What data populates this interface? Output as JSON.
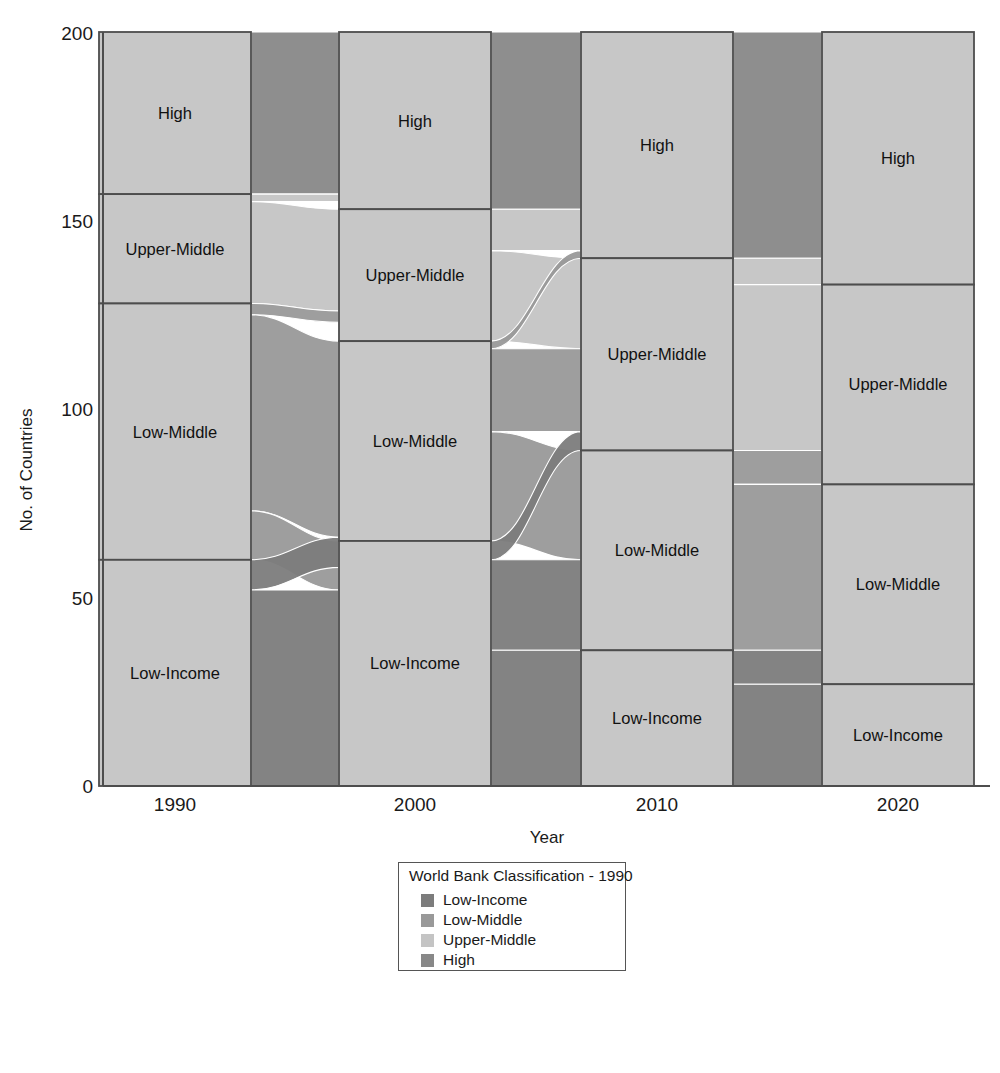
{
  "chart_data": {
    "type": "area",
    "subtype": "alluvial-sankey",
    "title": "",
    "xlabel": "Year",
    "ylabel": "No. of Countries",
    "ylim": [
      0,
      200
    ],
    "yticks": [
      0,
      50,
      100,
      150,
      200
    ],
    "ytick_labels": [
      "0",
      "50",
      "100",
      "150",
      "200"
    ],
    "grid": false,
    "legend_position": "bottom-center",
    "categories": [
      "1990",
      "2000",
      "2010",
      "2020"
    ],
    "classes": [
      "Low-Income",
      "Low-Middle",
      "Upper-Middle",
      "High"
    ],
    "colors": {
      "Low-Income": "#7c7c7c",
      "Low-Middle": "#999999",
      "Upper-Middle": "#c4c4c4",
      "High": "#888888",
      "stratum_fill": "#bbbbbb",
      "stratum_border": "#4d4d4d",
      "axis": "#4d4d4d"
    },
    "strata": [
      {
        "year": "1990",
        "values": {
          "Low-Income": 60,
          "Low-Middle": 68,
          "Upper-Middle": 29,
          "High": 43
        }
      },
      {
        "year": "2000",
        "values": {
          "Low-Income": 65,
          "Low-Middle": 53,
          "Upper-Middle": 35,
          "High": 47
        }
      },
      {
        "year": "2010",
        "values": {
          "Low-Income": 36,
          "Low-Middle": 53,
          "Upper-Middle": 51,
          "High": 60
        }
      },
      {
        "year": "2020",
        "values": {
          "Low-Income": 27,
          "Low-Middle": 53,
          "Upper-Middle": 53,
          "High": 67
        }
      }
    ],
    "flows": [
      {
        "from_year": "1990",
        "to_year": "2000",
        "from": "Low-Income",
        "to": "Low-Income",
        "value": 52
      },
      {
        "from_year": "1990",
        "to_year": "2000",
        "from": "Low-Income",
        "to": "Low-Middle",
        "value": 8
      },
      {
        "from_year": "1990",
        "to_year": "2000",
        "from": "Low-Middle",
        "to": "Low-Income",
        "value": 13
      },
      {
        "from_year": "1990",
        "to_year": "2000",
        "from": "Low-Middle",
        "to": "Low-Middle",
        "value": 52
      },
      {
        "from_year": "1990",
        "to_year": "2000",
        "from": "Low-Middle",
        "to": "Upper-Middle",
        "value": 3
      },
      {
        "from_year": "1990",
        "to_year": "2000",
        "from": "Upper-Middle",
        "to": "Upper-Middle",
        "value": 27
      },
      {
        "from_year": "1990",
        "to_year": "2000",
        "from": "Upper-Middle",
        "to": "High",
        "value": 2
      },
      {
        "from_year": "1990",
        "to_year": "2000",
        "from": "High",
        "to": "High",
        "value": 43
      },
      {
        "from_year": "2000",
        "to_year": "2010",
        "from": "Low-Income",
        "to": "Low-Income",
        "value": 36
      },
      {
        "from_year": "2000",
        "to_year": "2010",
        "from": "Low-Income",
        "to": "Low-Middle",
        "value": 24
      },
      {
        "from_year": "2000",
        "to_year": "2010",
        "from": "Low-Income",
        "to": "Upper-Middle",
        "value": 5
      },
      {
        "from_year": "2000",
        "to_year": "2010",
        "from": "Low-Middle",
        "to": "Low-Middle",
        "value": 29
      },
      {
        "from_year": "2000",
        "to_year": "2010",
        "from": "Low-Middle",
        "to": "Upper-Middle",
        "value": 22
      },
      {
        "from_year": "2000",
        "to_year": "2010",
        "from": "Low-Middle",
        "to": "High",
        "value": 2
      },
      {
        "from_year": "2000",
        "to_year": "2010",
        "from": "Upper-Middle",
        "to": "Upper-Middle",
        "value": 24
      },
      {
        "from_year": "2000",
        "to_year": "2010",
        "from": "Upper-Middle",
        "to": "High",
        "value": 11
      },
      {
        "from_year": "2000",
        "to_year": "2010",
        "from": "High",
        "to": "High",
        "value": 47
      },
      {
        "from_year": "2010",
        "to_year": "2020",
        "from": "Low-Income",
        "to": "Low-Income",
        "value": 27
      },
      {
        "from_year": "2010",
        "to_year": "2020",
        "from": "Low-Income",
        "to": "Low-Middle",
        "value": 9
      },
      {
        "from_year": "2010",
        "to_year": "2020",
        "from": "Low-Middle",
        "to": "Low-Middle",
        "value": 44
      },
      {
        "from_year": "2010",
        "to_year": "2020",
        "from": "Low-Middle",
        "to": "Upper-Middle",
        "value": 9
      },
      {
        "from_year": "2010",
        "to_year": "2020",
        "from": "Upper-Middle",
        "to": "Upper-Middle",
        "value": 44
      },
      {
        "from_year": "2010",
        "to_year": "2020",
        "from": "Upper-Middle",
        "to": "High",
        "value": 7
      },
      {
        "from_year": "2010",
        "to_year": "2020",
        "from": "High",
        "to": "High",
        "value": 60
      }
    ]
  },
  "axes": {
    "ylabel": "No. of Countries",
    "xlabel": "Year",
    "ytick_0": "0",
    "ytick_50": "50",
    "ytick_100": "100",
    "ytick_150": "150",
    "ytick_200": "200",
    "xtick_1990": "1990",
    "xtick_2000": "2000",
    "xtick_2010": "2010",
    "xtick_2020": "2020"
  },
  "stratum_labels": {
    "y1990": {
      "high": "High",
      "upper": "Upper-Middle",
      "lowmid": "Low-Middle",
      "lowinc": "Low-Income"
    },
    "y2000": {
      "high": "High",
      "upper": "Upper-Middle",
      "lowmid": "Low-Middle",
      "lowinc": "Low-Income"
    },
    "y2010": {
      "high": "High",
      "upper": "Upper-Middle",
      "lowmid": "Low-Middle",
      "lowinc": "Low-Income"
    },
    "y2020": {
      "high": "High",
      "upper": "Upper-Middle",
      "lowmid": "Low-Middle",
      "lowinc": "Low-Income"
    }
  },
  "legend": {
    "title": "World Bank Classification - 1990",
    "items": [
      {
        "label": "Low-Income",
        "color": "#7c7c7c"
      },
      {
        "label": "Low-Middle",
        "color": "#999999"
      },
      {
        "label": "Upper-Middle",
        "color": "#c4c4c4"
      },
      {
        "label": "High",
        "color": "#888888"
      }
    ]
  }
}
